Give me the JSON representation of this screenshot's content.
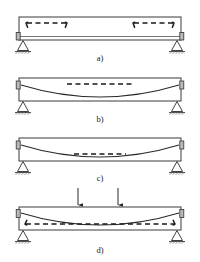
{
  "figure": {
    "width": 200,
    "height": 262,
    "background": "#ffffff",
    "line_color": "#2b2b2b",
    "beam_fill": "#ffffff",
    "beam_edge": "#3a3a3a",
    "dash_color": "#1a1a1a",
    "support_fill": "#ffffff",
    "anchor_fill": "#b9b9b9"
  },
  "panels": [
    {
      "id": "a",
      "label": "a)",
      "label_x": 100,
      "label_y": 61,
      "beam": {
        "x": 19,
        "y": 17,
        "width": 162,
        "height": 23
      },
      "description": "Beam with two hooked straight reinforcing bars near the top at each end",
      "elements": {
        "bars": [
          {
            "name": "hooked-bar-left",
            "x1": 27,
            "x2": 66,
            "y": 23,
            "hook_left": "down",
            "hook_right": "down"
          },
          {
            "name": "hooked-bar-right",
            "x1": 134,
            "x2": 173,
            "y": 23,
            "hook_left": "down",
            "hook_right": "down"
          }
        ],
        "tendon": null,
        "anchorages": [
          {
            "name": "anchorage-left",
            "x": 17,
            "y": 35
          },
          {
            "name": "anchorage-right",
            "x": 179,
            "y": 35
          }
        ],
        "supports": [
          {
            "name": "support-left",
            "x": 23,
            "y": 40,
            "type": "pinned-hatched"
          },
          {
            "name": "support-right",
            "x": 177,
            "y": 40,
            "type": "pinned-hatched"
          }
        ],
        "loads": []
      }
    },
    {
      "id": "b",
      "label": "b)",
      "label_x": 100,
      "label_y": 122,
      "beam": {
        "x": 19,
        "y": 78,
        "width": 162,
        "height": 23
      },
      "description": "Beam with draped parabolic tendon anchored at mid-height ends, and dashed bar near top",
      "elements": {
        "bars": [
          {
            "name": "dashed-bar-top",
            "x1": 67,
            "x2": 133,
            "y": 84,
            "hook_left": "none",
            "hook_right": "none"
          }
        ],
        "tendon": {
          "name": "draped-tendon",
          "x1": 21,
          "y1": 85,
          "x2": 179,
          "y2": 85,
          "sag_y": 97
        },
        "anchorages": [
          {
            "name": "anchorage-left",
            "x": 17,
            "y": 85
          },
          {
            "name": "anchorage-right",
            "x": 179,
            "y": 85
          }
        ],
        "supports": [
          {
            "name": "support-left",
            "x": 23,
            "y": 101,
            "type": "pinned-hatched"
          },
          {
            "name": "support-right",
            "x": 177,
            "y": 101,
            "type": "pinned-hatched"
          }
        ],
        "loads": []
      }
    },
    {
      "id": "c",
      "label": "c)",
      "label_x": 100,
      "label_y": 181,
      "beam": {
        "x": 19,
        "y": 138,
        "width": 162,
        "height": 23
      },
      "description": "Beam with draped tendon and short dashed bar just above the lowest point of the drape",
      "elements": {
        "bars": [
          {
            "name": "dashed-bar-mid",
            "x1": 74,
            "x2": 126,
            "y": 154,
            "hook_left": "none",
            "hook_right": "none"
          }
        ],
        "tendon": {
          "name": "draped-tendon",
          "x1": 21,
          "y1": 145,
          "x2": 179,
          "y2": 145,
          "sag_y": 157
        },
        "anchorages": [
          {
            "name": "anchorage-left",
            "x": 17,
            "y": 145
          },
          {
            "name": "anchorage-right",
            "x": 179,
            "y": 145
          }
        ],
        "supports": [
          {
            "name": "support-left",
            "x": 23,
            "y": 161,
            "type": "pinned-hatched"
          },
          {
            "name": "support-right",
            "x": 177,
            "y": 161,
            "type": "pinned-hatched"
          }
        ],
        "loads": []
      }
    },
    {
      "id": "d",
      "label": "d)",
      "label_x": 100,
      "label_y": 253,
      "beam": {
        "x": 19,
        "y": 207,
        "width": 162,
        "height": 23
      },
      "description": "Beam with two point loads on top, draped tendon, and a full-length hooked dashed bar near the bottom",
      "elements": {
        "bars": [
          {
            "name": "hooked-bar-bottom",
            "x1": 26,
            "x2": 174,
            "y": 224,
            "hook_left": "up",
            "hook_right": "up"
          }
        ],
        "tendon": {
          "name": "draped-tendon",
          "x1": 21,
          "y1": 213,
          "x2": 179,
          "y2": 213,
          "sag_y": 225
        },
        "anchorages": [
          {
            "name": "anchorage-left",
            "x": 17,
            "y": 213
          },
          {
            "name": "anchorage-right",
            "x": 179,
            "y": 213
          }
        ],
        "supports": [
          {
            "name": "support-left",
            "x": 23,
            "y": 230,
            "type": "pinned-hatched"
          },
          {
            "name": "support-right",
            "x": 177,
            "y": 230,
            "type": "pinned-hatched"
          }
        ],
        "loads": [
          {
            "name": "point-load-left",
            "x": 78,
            "y_start": 188,
            "y_end": 206,
            "direction": "down"
          },
          {
            "name": "point-load-right",
            "x": 118,
            "y_start": 188,
            "y_end": 206,
            "direction": "down"
          }
        ]
      }
    }
  ]
}
